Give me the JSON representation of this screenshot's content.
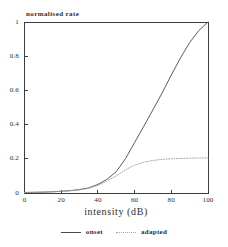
{
  "figure": {
    "y_axis_title": "normalised rate",
    "x_axis_title": "intensity (dB)",
    "legend": {
      "onset_label": "onset",
      "adapted_label": "adapted"
    },
    "colors": {
      "background": "#ffffff",
      "axis": "#3d3d3d",
      "text": "#2e2e2e",
      "onset_line": "#4a4a4a",
      "adapted_line": "#a6a6a6"
    }
  },
  "chart_data": {
    "type": "line",
    "title": "",
    "xlabel": "intensity (dB)",
    "ylabel": "normalised rate",
    "xlim": [
      0,
      100
    ],
    "ylim": [
      0,
      1
    ],
    "x_ticks": [
      0,
      20,
      40,
      60,
      80,
      100
    ],
    "y_ticks": [
      1,
      0.8,
      0.6,
      0.4,
      0.2,
      0
    ],
    "grid": false,
    "legend_position": "bottom",
    "x": [
      0,
      5,
      10,
      15,
      20,
      25,
      30,
      35,
      40,
      45,
      50,
      55,
      60,
      65,
      70,
      75,
      80,
      85,
      90,
      95,
      100
    ],
    "series": [
      {
        "name": "onset",
        "style": "solid",
        "values": [
          0.003,
          0.004,
          0.005,
          0.007,
          0.01,
          0.014,
          0.02,
          0.03,
          0.05,
          0.08,
          0.125,
          0.2,
          0.295,
          0.39,
          0.487,
          0.585,
          0.69,
          0.79,
          0.88,
          0.95,
          1.0
        ]
      },
      {
        "name": "adapted",
        "style": "dotted",
        "values": [
          0.003,
          0.004,
          0.005,
          0.007,
          0.01,
          0.013,
          0.018,
          0.027,
          0.045,
          0.07,
          0.1,
          0.135,
          0.163,
          0.18,
          0.19,
          0.197,
          0.2,
          0.202,
          0.204,
          0.205,
          0.205
        ]
      }
    ]
  }
}
